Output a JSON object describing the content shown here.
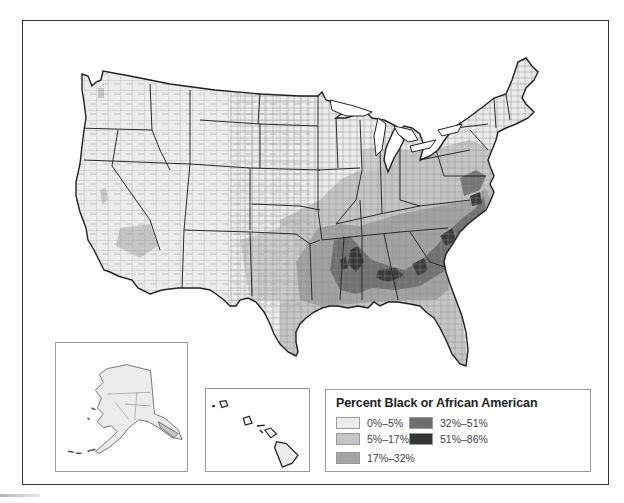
{
  "map": {
    "title": "Percent Black or African American",
    "subject": "United States counties",
    "insets": [
      {
        "name": "Alaska"
      },
      {
        "name": "Hawaii"
      }
    ]
  },
  "legend": {
    "title": "Percent Black or African American",
    "items": [
      {
        "label": "0%–5%",
        "color": "#ececec"
      },
      {
        "label": "5%–17%",
        "color": "#c6c6c6"
      },
      {
        "label": "17%–32%",
        "color": "#a4a4a4"
      },
      {
        "label": "32%–51%",
        "color": "#6f6f6f"
      },
      {
        "label": "51%–86%",
        "color": "#353535"
      }
    ]
  },
  "colors": {
    "border": "#333333",
    "county_line": "#777777",
    "inset_border": "#9a9a9a"
  }
}
